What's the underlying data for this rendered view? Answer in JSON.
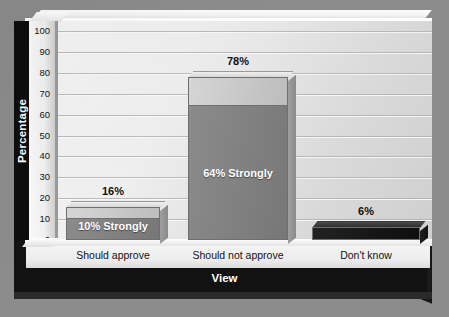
{
  "chart_data": {
    "type": "bar",
    "title": "",
    "xlabel": "View",
    "ylabel": "Percentage",
    "categories": [
      "Should approve",
      "Should not approve",
      "Don't know"
    ],
    "values": [
      16,
      78,
      6
    ],
    "value_labels": [
      "16%",
      "78%",
      "6%"
    ],
    "series": [
      {
        "name": "Total",
        "values": [
          16,
          78,
          6
        ]
      },
      {
        "name": "Strongly",
        "values": [
          10,
          64,
          0
        ]
      }
    ],
    "inner_labels": [
      "10% Strongly",
      "64% Strongly",
      ""
    ],
    "ylim": [
      0,
      100
    ],
    "ytick_step": 10,
    "yticks": [
      "100",
      "90",
      "80",
      "70",
      "60",
      "50",
      "40",
      "30",
      "20",
      "10",
      "0"
    ],
    "grid": true,
    "legend": "none",
    "style": "3d",
    "colors": {
      "bar_total": "#c9c9c9",
      "bar_strongly": "#818181",
      "bar_dark": "#161616",
      "wall": "#eeeeee",
      "base": "#121212",
      "background": "#8c8c8c",
      "text": "#121212",
      "inner_text": "#ffffff"
    }
  },
  "axis": {
    "y_label": "Percentage",
    "x_label": "View",
    "ticks": [
      "100",
      "90",
      "80",
      "70",
      "60",
      "50",
      "40",
      "30",
      "20",
      "10",
      "0"
    ]
  },
  "bars": [
    {
      "category": "Should approve",
      "value_label": "16%",
      "inner_label": "10% Strongly"
    },
    {
      "category": "Should not approve",
      "value_label": "78%",
      "inner_label": "64% Strongly"
    },
    {
      "category": "Don't know",
      "value_label": "6%",
      "inner_label": ""
    }
  ]
}
